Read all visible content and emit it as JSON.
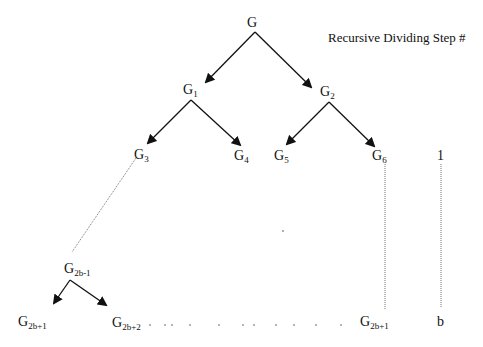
{
  "heading": "Recursive Dividing Step #",
  "nodes": {
    "root": {
      "main": "G",
      "sub": ""
    },
    "g1": {
      "main": "G",
      "sub": "1"
    },
    "g2": {
      "main": "G",
      "sub": "2"
    },
    "g3": {
      "main": "G",
      "sub": "3"
    },
    "g4": {
      "main": "G",
      "sub": "4"
    },
    "g5": {
      "main": "G",
      "sub": "5"
    },
    "g6": {
      "main": "G",
      "sub": "6"
    },
    "g2bm1": {
      "main": "G",
      "sub": "2b-1"
    },
    "g2bp1_left": {
      "main": "G",
      "sub": "2b+1"
    },
    "g2bp2": {
      "main": "G",
      "sub": "2b+2"
    },
    "g2bp1_right": {
      "main": "G",
      "sub": "2b+1"
    }
  },
  "steps": {
    "first": "1",
    "last": "b"
  },
  "ellipsis_dots": ". . . . . . . . . . . .",
  "colors": {
    "line": "#111111",
    "dotted": "#777777"
  }
}
